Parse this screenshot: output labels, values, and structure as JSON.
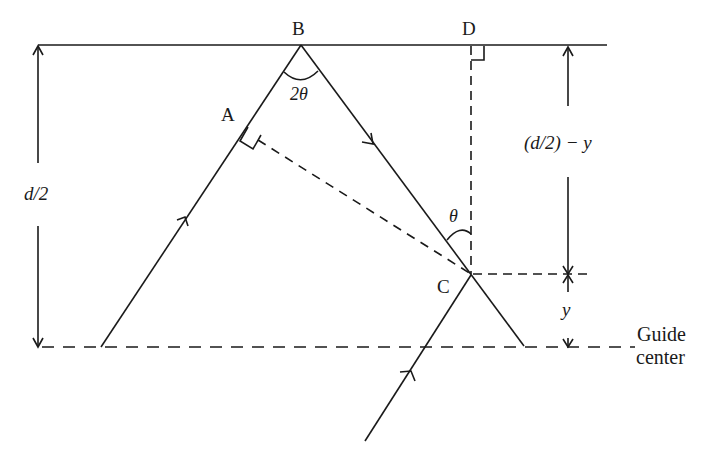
{
  "diagram": {
    "type": "waveguide-ray-geometry",
    "points": {
      "A": "A",
      "B": "B",
      "C": "C",
      "D": "D"
    },
    "angles": {
      "apex": "2θ",
      "at_C": "θ"
    },
    "dimensions": {
      "half_width": "d/2",
      "upper_segment": "(d/2) − y",
      "lower_segment": "y"
    },
    "reference_line": {
      "label_line1": "Guide",
      "label_line2": "center"
    },
    "colors": {
      "ink": "#1a1a1a",
      "background": "#ffffff"
    }
  }
}
